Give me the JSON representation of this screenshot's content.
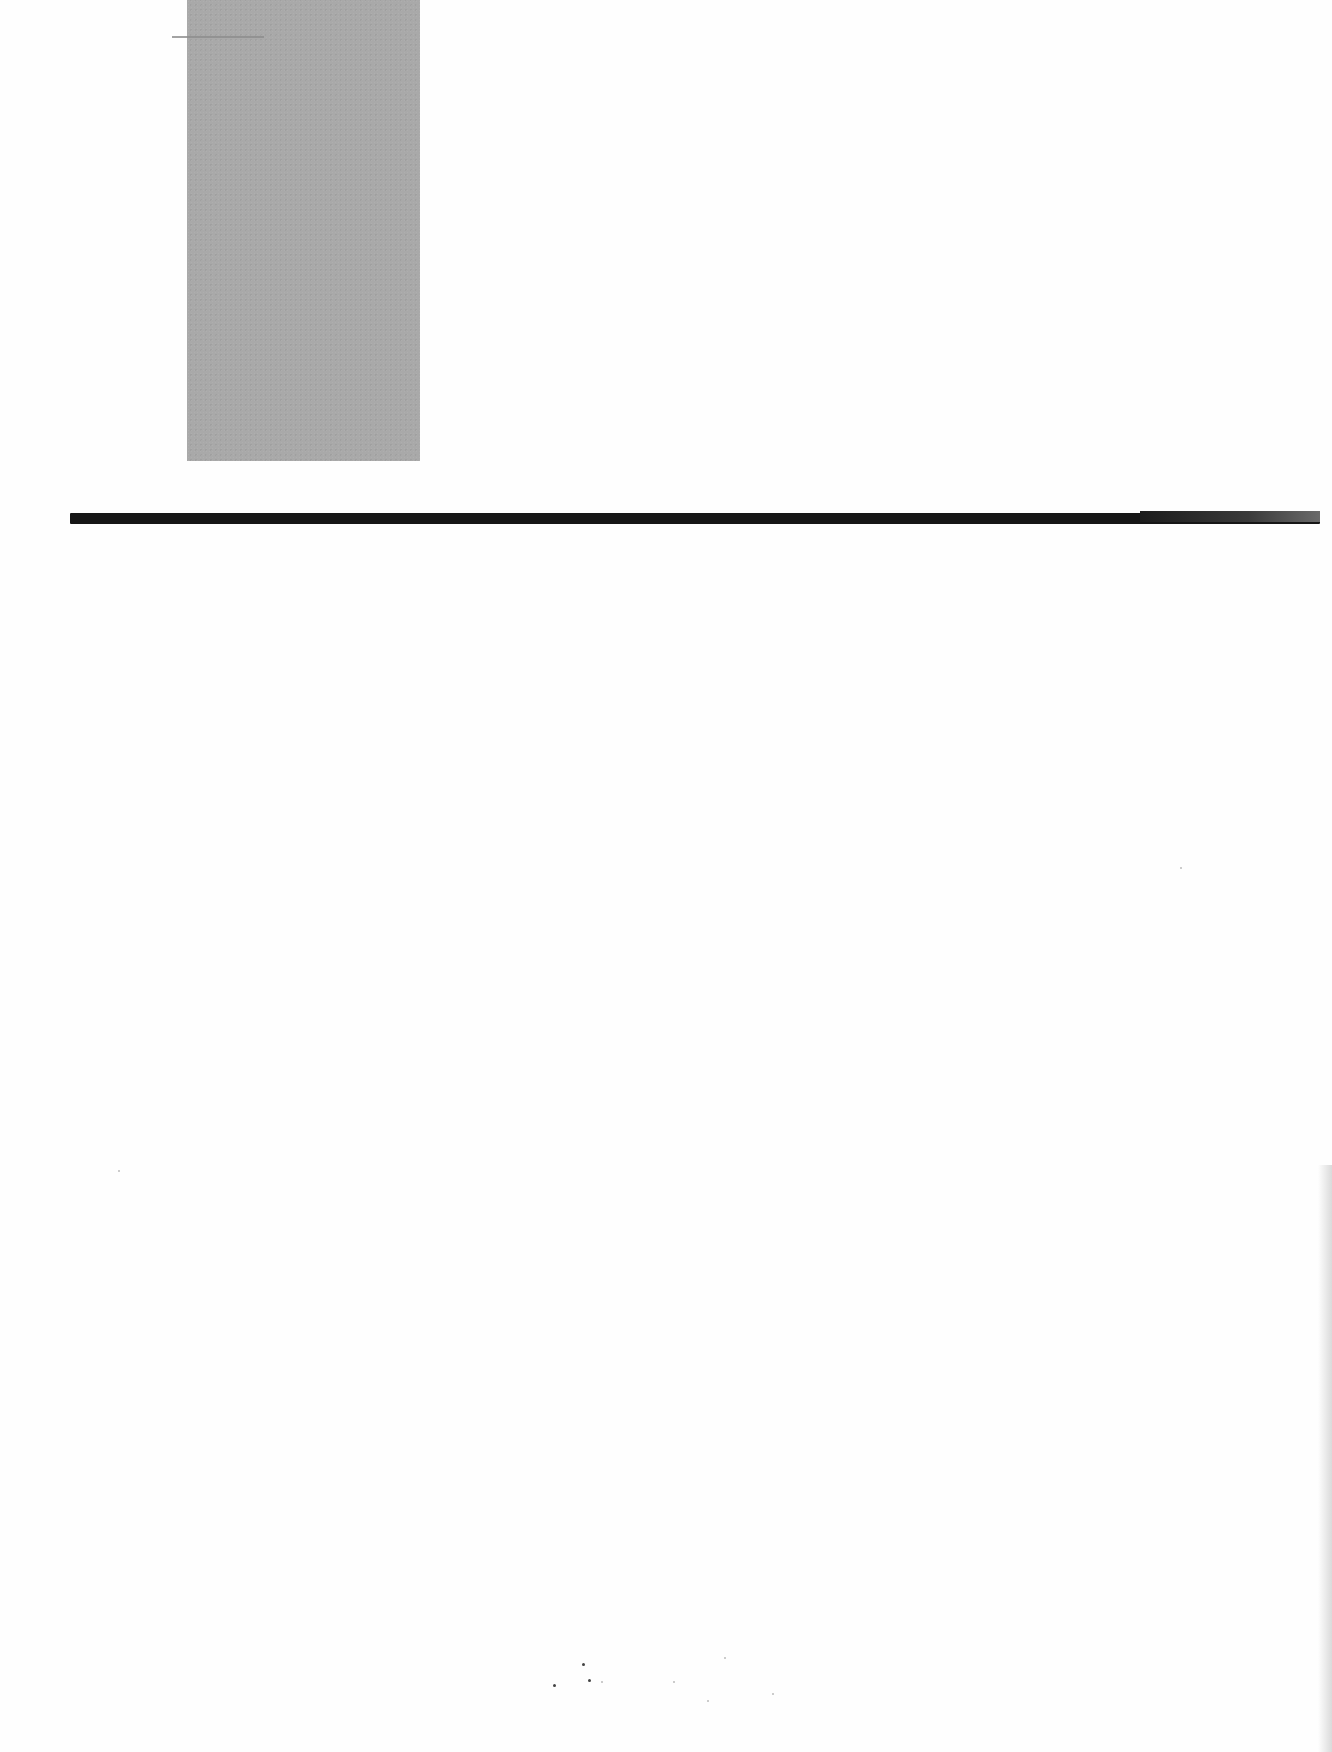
{
  "document": {
    "type": "scanned-page",
    "text_content": "",
    "elements": {
      "image_block": {
        "description": "grey rectangular image placeholder",
        "color": "#a9a9a9"
      },
      "horizontal_rule": {
        "description": "thick black horizontal rule",
        "color": "#161616"
      },
      "short_rule": {
        "description": "thin short grey line near top",
        "color": "#8c8c8c"
      }
    }
  }
}
